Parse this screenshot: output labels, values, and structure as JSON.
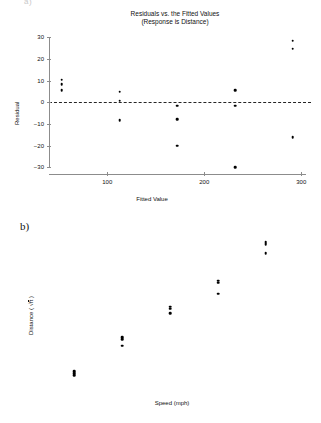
{
  "figure": {
    "clipped_top_text": "a)",
    "panel_b_tag": "b)"
  },
  "panel_a": {
    "tag": "a)",
    "chart_data": {
      "type": "scatter",
      "title": "Residuals vs. the Fitted Values",
      "subtitle": "(Response is Distance)",
      "xlabel": "Fitted Value",
      "ylabel": "Residual",
      "xlim": [
        40,
        310
      ],
      "ylim": [
        -33,
        32
      ],
      "xticks": [
        100,
        200,
        300
      ],
      "yticks": [
        30,
        20,
        10,
        0,
        -10,
        -20,
        -30
      ],
      "grid": false,
      "legend": "none",
      "reference_line": {
        "orientation": "horizontal",
        "y": 0,
        "style": "dashed"
      },
      "x": [
        53,
        53,
        53,
        113,
        113,
        113,
        172,
        172,
        172,
        232,
        232,
        232,
        291,
        291,
        291
      ],
      "y": [
        10.5,
        8.5,
        5.5,
        5.0,
        0.7,
        -8.2,
        -1.5,
        -7.8,
        -20.0,
        5.5,
        -1.5,
        -29.8,
        28.5,
        24.8,
        -16.0
      ],
      "points": [
        {
          "x": 53,
          "y": 10.5
        },
        {
          "x": 53,
          "y": 8.5
        },
        {
          "x": 53,
          "y": 5.5
        },
        {
          "x": 113,
          "y": 5.0
        },
        {
          "x": 113,
          "y": 0.7
        },
        {
          "x": 113,
          "y": -8.2
        },
        {
          "x": 172,
          "y": -1.5
        },
        {
          "x": 172,
          "y": -7.8
        },
        {
          "x": 172,
          "y": -20.0
        },
        {
          "x": 232,
          "y": 5.5
        },
        {
          "x": 232,
          "y": -1.5
        },
        {
          "x": 232,
          "y": -29.8
        },
        {
          "x": 291,
          "y": 28.5
        },
        {
          "x": 291,
          "y": 24.8
        },
        {
          "x": 291,
          "y": -16.0
        }
      ]
    }
  },
  "panel_b": {
    "tag": "b)",
    "chart_data": {
      "type": "scatter",
      "title": "",
      "xlabel": "Speed (mph)",
      "ylabel": "Distance ( √ft )",
      "ylabel_prefix": "Distance ( ",
      "ylabel_radicand": "ft",
      "ylabel_suffix": " )",
      "xlim": [
        17,
        64
      ],
      "ylim": [
        7.4,
        18.6
      ],
      "xticks": [
        20,
        30,
        40,
        50,
        60
      ],
      "yticks": [
        8,
        13,
        18
      ],
      "grid": false,
      "legend": "none",
      "x": [
        20,
        20,
        20,
        30,
        30,
        30,
        40,
        40,
        40,
        50,
        50,
        50,
        60,
        60,
        60
      ],
      "y": [
        8.15,
        8.0,
        7.85,
        10.75,
        10.6,
        10.1,
        13.1,
        12.95,
        12.6,
        15.1,
        14.95,
        14.1,
        18.05,
        17.9,
        17.2
      ],
      "points": [
        {
          "x": 20,
          "y": 8.15
        },
        {
          "x": 20,
          "y": 8.0
        },
        {
          "x": 20,
          "y": 7.85
        },
        {
          "x": 30,
          "y": 10.75
        },
        {
          "x": 30,
          "y": 10.6
        },
        {
          "x": 30,
          "y": 10.1
        },
        {
          "x": 40,
          "y": 13.1
        },
        {
          "x": 40,
          "y": 12.95
        },
        {
          "x": 40,
          "y": 12.6
        },
        {
          "x": 50,
          "y": 15.1
        },
        {
          "x": 50,
          "y": 14.95
        },
        {
          "x": 50,
          "y": 14.1
        },
        {
          "x": 60,
          "y": 18.05
        },
        {
          "x": 60,
          "y": 17.9
        },
        {
          "x": 60,
          "y": 17.2
        }
      ]
    }
  },
  "colors": {
    "axis": "#8c8c8c",
    "marker": "#000000",
    "text": "#111111",
    "background": "#ffffff"
  }
}
